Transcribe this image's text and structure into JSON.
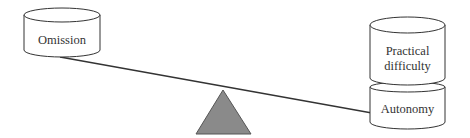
{
  "diagram": {
    "type": "balance-scale",
    "left_pan": {
      "items": [
        {
          "label": "Omission"
        }
      ]
    },
    "right_pan": {
      "items": [
        {
          "label_line1": "Practical",
          "label_line2": "difficulty"
        },
        {
          "label": "Autonomy"
        }
      ]
    },
    "colors": {
      "stroke": "#333333",
      "fulcrum_fill": "#8a8a8a",
      "cylinder_fill": "#ffffff",
      "background": "#ffffff"
    }
  }
}
